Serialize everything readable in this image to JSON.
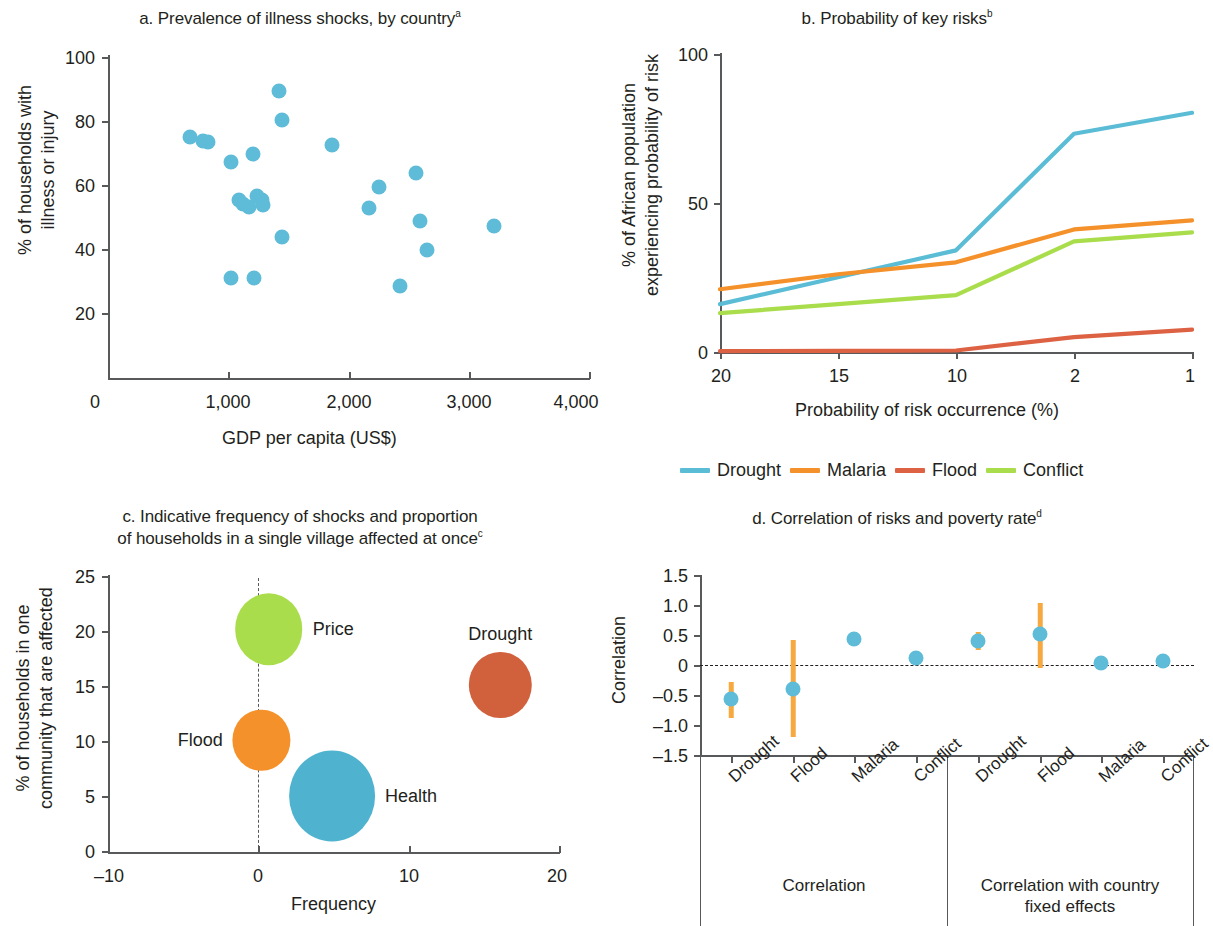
{
  "colors": {
    "drought_line": "#5bbcd6",
    "malaria_line": "#f5912a",
    "flood_line": "#dd6244",
    "conflict_line": "#a9dd4b",
    "scatter_blue": "#5fbcd8",
    "bubble_price": "#a9dd4b",
    "bubble_flood": "#f5912a",
    "bubble_health": "#4fb3d0",
    "bubble_drought": "#d1603c",
    "errorbar": "#f7a940",
    "axis": "#58595b",
    "text": "#231f20"
  },
  "panel_a": {
    "title": "a. Prevalence of illness shocks, by country",
    "title_sup": "a",
    "xlabel": "GDP per capita (US$)",
    "ylabel_line1": "% of households with",
    "ylabel_line2": "illness or injury",
    "xticks": [
      "0",
      "1,000",
      "2,000",
      "3,000",
      "4,000"
    ],
    "yticks": [
      "100",
      "80",
      "60",
      "40",
      "20"
    ]
  },
  "panel_b": {
    "title": "b. Probability of key risks",
    "title_sup": "b",
    "xlabel": "Probability of risk occurrence (%)",
    "ylabel_line1": "% of African population",
    "ylabel_line2": "experiencing probability of risk",
    "xticks": [
      "20",
      "15",
      "10",
      "2",
      "1"
    ],
    "yticks": [
      "100",
      "50",
      "0"
    ],
    "legend": [
      "Drought",
      "Malaria",
      "Flood",
      "Conflict"
    ]
  },
  "panel_c": {
    "title_line1": "c. Indicative frequency of shocks and proportion",
    "title_line2": "of households in a single village affected at once",
    "title_sup": "c",
    "xlabel": "Frequency",
    "ylabel_line1": "% of households in one",
    "ylabel_line2": "community that are affected",
    "xticks": [
      "–10",
      "0",
      "10",
      "20"
    ],
    "yticks": [
      "25",
      "20",
      "15",
      "10",
      "5",
      "0"
    ]
  },
  "panel_d": {
    "title": "d. Correlation of risks and poverty rate",
    "title_sup": "d",
    "ylabel": "Correlation",
    "yticks": [
      "1.5",
      "1.0",
      "0.5",
      "0",
      "–0.5",
      "–1.0",
      "–1.5"
    ],
    "category_labels": [
      "Drought",
      "Flood",
      "Malaria",
      "Conflict",
      "Drought",
      "Flood",
      "Malaria",
      "Conflict"
    ],
    "group_label_1": "Correlation",
    "group_label_2_line1": "Correlation with country",
    "group_label_2_line2": "fixed effects"
  },
  "chart_data": [
    {
      "panel": "a",
      "type": "scatter",
      "title": "a. Prevalence of illness shocks, by country",
      "xlabel": "GDP per capita (US$)",
      "ylabel": "% of households with illness or injury",
      "xlim": [
        0,
        4000
      ],
      "ylim": [
        0,
        100
      ],
      "xticks": [
        0,
        1000,
        2000,
        3000,
        4000
      ],
      "yticks": [
        20,
        40,
        60,
        80,
        100
      ],
      "grid": false,
      "points": [
        {
          "x": 680,
          "y": 74.5
        },
        {
          "x": 790,
          "y": 73.5
        },
        {
          "x": 830,
          "y": 73.0
        },
        {
          "x": 1020,
          "y": 67.0
        },
        {
          "x": 1200,
          "y": 69.5
        },
        {
          "x": 1420,
          "y": 89.0
        },
        {
          "x": 1440,
          "y": 80.0
        },
        {
          "x": 1860,
          "y": 72.0
        },
        {
          "x": 1090,
          "y": 55.0
        },
        {
          "x": 1120,
          "y": 54.0
        },
        {
          "x": 1170,
          "y": 53.0
        },
        {
          "x": 1240,
          "y": 56.5
        },
        {
          "x": 1280,
          "y": 55.0
        },
        {
          "x": 1290,
          "y": 53.5
        },
        {
          "x": 1440,
          "y": 43.5
        },
        {
          "x": 1020,
          "y": 31.0
        },
        {
          "x": 1210,
          "y": 31.0
        },
        {
          "x": 2170,
          "y": 52.5
        },
        {
          "x": 2250,
          "y": 59.0
        },
        {
          "x": 2560,
          "y": 63.5
        },
        {
          "x": 2590,
          "y": 48.5
        },
        {
          "x": 2650,
          "y": 39.5
        },
        {
          "x": 2420,
          "y": 28.5
        },
        {
          "x": 3200,
          "y": 47.0
        }
      ]
    },
    {
      "panel": "b",
      "type": "line",
      "title": "b. Probability of key risks",
      "xlabel": "Probability of risk occurrence (%)",
      "ylabel": "% of African population experiencing probability of risk",
      "x": [
        20,
        15,
        10,
        2,
        1
      ],
      "xlim_labels": [
        "20",
        "15",
        "10",
        "2",
        "1"
      ],
      "ylim": [
        0,
        100
      ],
      "yticks": [
        0,
        50,
        100
      ],
      "grid": false,
      "legend_position": "bottom",
      "series": [
        {
          "name": "Drought",
          "color": "#5bbcd6",
          "values": [
            16,
            25,
            34,
            73,
            80
          ]
        },
        {
          "name": "Malaria",
          "color": "#f5912a",
          "values": [
            21,
            26,
            30,
            41,
            44
          ]
        },
        {
          "name": "Flood",
          "color": "#dd6244",
          "values": [
            0.3,
            0.4,
            0.5,
            5,
            7.5
          ]
        },
        {
          "name": "Conflict",
          "color": "#a9dd4b",
          "values": [
            13,
            16,
            19,
            37,
            40
          ]
        }
      ]
    },
    {
      "panel": "c",
      "type": "scatter",
      "title": "c. Indicative frequency of shocks and proportion of households in a single village affected at once",
      "xlabel": "Frequency",
      "ylabel": "% of households in one community that are affected",
      "xlim": [
        -10,
        20
      ],
      "ylim": [
        0,
        25
      ],
      "xticks": [
        -10,
        0,
        10,
        20
      ],
      "yticks": [
        0,
        5,
        10,
        15,
        20,
        25
      ],
      "grid": false,
      "bubbles": [
        {
          "label": "Price",
          "x": 0.7,
          "y": 20.2,
          "size": 2.6,
          "color": "#a9dd4b",
          "label_side": "right"
        },
        {
          "label": "Flood",
          "x": 0.2,
          "y": 10.1,
          "size": 2.2,
          "color": "#f5912a",
          "label_side": "left"
        },
        {
          "label": "Health",
          "x": 4.9,
          "y": 5.1,
          "size": 3.3,
          "color": "#4fb3d0",
          "label_side": "right"
        },
        {
          "label": "Drought",
          "x": 16.1,
          "y": 15.1,
          "size": 2.4,
          "color": "#d1603c",
          "label_side": "above"
        }
      ]
    },
    {
      "panel": "d",
      "type": "scatter",
      "title": "d. Correlation of risks and poverty rate",
      "ylabel": "Correlation",
      "ylim": [
        -1.5,
        1.5
      ],
      "yticks": [
        -1.5,
        -1.0,
        -0.5,
        0,
        0.5,
        1.0,
        1.5
      ],
      "grid": false,
      "reference_line": 0,
      "categories": [
        "Drought",
        "Flood",
        "Malaria",
        "Conflict",
        "Drought",
        "Flood",
        "Malaria",
        "Conflict"
      ],
      "groups": [
        "Correlation",
        "Correlation with country fixed effects"
      ],
      "values": [
        -0.56,
        -0.4,
        0.43,
        0.12,
        0.4,
        0.51,
        0.04,
        0.06
      ],
      "ci_lower": [
        -0.88,
        -1.2,
        0.36,
        null,
        0.25,
        -0.05,
        null,
        null
      ],
      "ci_upper": [
        -0.29,
        0.41,
        0.49,
        null,
        0.55,
        1.04,
        null,
        null
      ]
    }
  ]
}
